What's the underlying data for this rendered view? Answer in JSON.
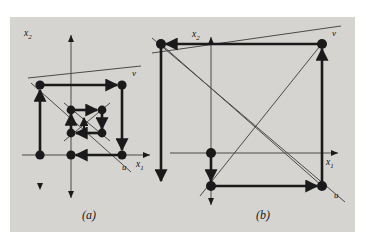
{
  "figure": {
    "background_color": "#ffffff",
    "panel_color": "#d6d4d1",
    "ink_color": "#1a1a1a",
    "thin_color": "#3a3a3a",
    "captions": [
      {
        "id": "caption-a",
        "text": "(a)",
        "x": 84,
        "y": 210
      },
      {
        "id": "caption-b",
        "text": "(b)",
        "x": 258,
        "y": 210
      }
    ]
  },
  "panel_a": {
    "caption": "(a)",
    "axis_labels": {
      "x1": "x",
      "x1_sub": "1",
      "x2": "x",
      "x2_sub": "2"
    },
    "node_labels": [
      {
        "id": "label-v-a",
        "text": "v",
        "x": 132,
        "y": 74
      },
      {
        "id": "label-u-a",
        "text": "u",
        "x": 124,
        "y": 167
      }
    ],
    "axes": {
      "x_axis_y": 155,
      "y_axis_x": 71,
      "x_axis_x0": 22,
      "x_axis_x1": 150,
      "y_axis_y0": 35,
      "y_axis_y1": 198
    },
    "nodes": [
      {
        "id": "n-a-1",
        "x": 40,
        "y": 85
      },
      {
        "id": "n-a-2",
        "x": 122,
        "y": 85
      },
      {
        "id": "n-a-3",
        "x": 40,
        "y": 155
      },
      {
        "id": "n-a-4",
        "x": 71,
        "y": 155
      },
      {
        "id": "n-a-5",
        "x": 122,
        "y": 155
      },
      {
        "id": "n-a-6",
        "x": 71,
        "y": 110
      },
      {
        "id": "n-a-7",
        "x": 102,
        "y": 110
      },
      {
        "id": "n-a-8",
        "x": 71,
        "y": 133
      },
      {
        "id": "n-a-9",
        "x": 102,
        "y": 133
      }
    ],
    "diagonals": [
      {
        "id": "diag-a-v",
        "x1": 30,
        "y1": 76,
        "x2": 140,
        "y2": 68
      },
      {
        "id": "diag-a-u",
        "x1": 33,
        "y1": 85,
        "x2": 130,
        "y2": 168
      }
    ]
  },
  "panel_b": {
    "caption": "(b)",
    "axis_labels": {
      "x1": "x",
      "x1_sub": "1",
      "x2": "x",
      "x2_sub": "2"
    },
    "node_labels": [
      {
        "id": "label-v-b",
        "text": "v",
        "x": 331,
        "y": 33
      },
      {
        "id": "label-u-b",
        "text": "u",
        "x": 333,
        "y": 196
      }
    ],
    "axes": {
      "x_axis_y": 153,
      "y_axis_x": 211,
      "x_axis_x0": 170,
      "x_axis_x1": 338,
      "y_axis_y0": 37,
      "y_axis_y1": 205
    },
    "nodes": [
      {
        "id": "n-b-1",
        "x": 161,
        "y": 44
      },
      {
        "id": "n-b-2",
        "x": 322,
        "y": 44
      },
      {
        "id": "n-b-3",
        "x": 211,
        "y": 153
      },
      {
        "id": "n-b-4",
        "x": 211,
        "y": 186
      },
      {
        "id": "n-b-5",
        "x": 322,
        "y": 186
      }
    ],
    "diagonals": [
      {
        "id": "diag-b-v",
        "x1": 152,
        "y1": 52,
        "x2": 341,
        "y2": 27
      },
      {
        "id": "diag-b-u",
        "x1": 152,
        "y1": 40,
        "x2": 344,
        "y2": 200
      }
    ]
  }
}
